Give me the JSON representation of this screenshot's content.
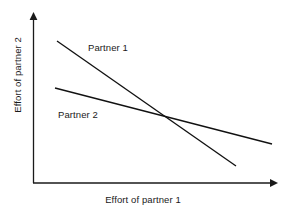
{
  "figure": {
    "background_color": "#ffffff",
    "line_color": "#111111",
    "axis_color": "#1a1a1a",
    "width": 286,
    "height": 216
  },
  "axes": {
    "x_title": "Effort of partner 1",
    "y_title": "Effort of partner 2",
    "x_axis_name": "x-axis-with-arrow",
    "y_axis_name": "y-axis-with-arrow"
  },
  "labels": {
    "partner_1": "Partner 1",
    "partner_2": "Partner 2"
  },
  "chart_data": {
    "type": "line",
    "title": "",
    "subtitle": "",
    "xlabel": "Effort of partner 1",
    "ylabel": "Effort of partner 2",
    "xlim": [
      0,
      1
    ],
    "ylim": [
      0,
      1
    ],
    "grid": false,
    "legend": "inline-annotations",
    "axis_style": "arrow-tipped, no tick marks, no tick labels",
    "annotations": [
      {
        "text": "Partner 1",
        "x_px": 88,
        "y_px": 49
      },
      {
        "text": "Partner 2",
        "x_px": 58,
        "y_px": 116
      }
    ],
    "series": [
      {
        "name": "Partner 1",
        "description": "Steeper downward-sloping best-response line",
        "x": [
          0.098,
          0.832
        ],
        "y": [
          0.835,
          0.1
        ],
        "x_px": [
          57,
          236
        ],
        "y_px": [
          41,
          166
        ],
        "slope_px": -0.699
      },
      {
        "name": "Partner 2",
        "description": "Flatter downward-sloping best-response line",
        "x": [
          0.09,
          0.98
        ],
        "y": [
          0.559,
          0.229
        ],
        "x_px": [
          55,
          272
        ],
        "y_px": [
          88,
          144
        ],
        "slope_px": -0.258
      }
    ],
    "intersection": {
      "label": "equilibrium",
      "x_px": 163,
      "y_px": 116,
      "x": 0.533,
      "y": 0.394
    }
  }
}
